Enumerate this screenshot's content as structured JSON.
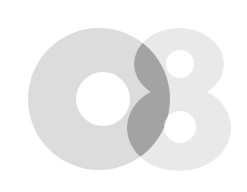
{
  "logo": {
    "label": "O8",
    "colors": {
      "background": "#ffffff",
      "ring": "#dcdcdc",
      "eight": "#e9e9e9",
      "overlap": "#a3a3a3",
      "hole": "#ffffff"
    },
    "ring": {
      "cx": 99,
      "cy": 99,
      "r": 71,
      "hole_cx": 103,
      "hole_cy": 99,
      "hole_r": 27
    },
    "eight": {
      "top": {
        "cx": 179,
        "cy": 64,
        "rx": 45,
        "ry": 36,
        "hole_cx": 180,
        "hole_cy": 64,
        "hole_r": 14
      },
      "bottom": {
        "cx": 179,
        "cy": 128,
        "rx": 52,
        "ry": 43,
        "hole_cx": 180,
        "hole_cy": 127,
        "hole_r": 16
      }
    }
  }
}
